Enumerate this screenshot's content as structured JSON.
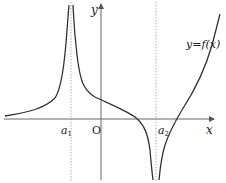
{
  "diagram": {
    "axes": {
      "x_label": "x",
      "y_label": "y",
      "origin_label": "O"
    },
    "asymptotes": [
      {
        "label_base": "a",
        "label_sub": "1",
        "side": "left of origin",
        "behavior": "f → +∞ on both sides"
      },
      {
        "label_base": "a",
        "label_sub": "2",
        "side": "right of origin",
        "behavior": "f → −∞ on both sides"
      }
    ],
    "curve_label": "y=f(x)",
    "colors": {
      "curve": "#333333",
      "axes": "#555555",
      "asymptote": "#888888",
      "background": "#ffffff"
    }
  }
}
